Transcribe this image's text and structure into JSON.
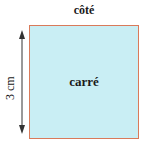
{
  "diagram": {
    "top_label": "côté",
    "center_label": "carré",
    "side_label": "3 cm",
    "colors": {
      "fill": "#c9eef4",
      "border": "#d97a5a",
      "arrow": "#333333"
    }
  }
}
